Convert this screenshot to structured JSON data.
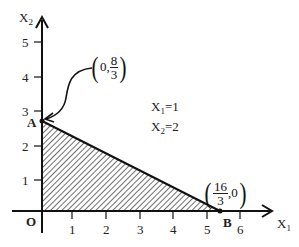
{
  "diagram": {
    "axes": {
      "x_label": "X",
      "x_label_sub": "1",
      "y_label": "X",
      "y_label_sub": "2",
      "origin_label": "O",
      "x_ticks": [
        "1",
        "2",
        "3",
        "4",
        "5",
        "6"
      ],
      "y_ticks": [
        "1",
        "2",
        "3",
        "4",
        "5"
      ]
    },
    "points": {
      "A": {
        "label": "A",
        "coord_left": "0,",
        "num": "8",
        "den": "3",
        "coord_right": ""
      },
      "B": {
        "label": "B",
        "coord_left": "",
        "num": "16",
        "den": "3",
        "coord_right": ",0"
      }
    },
    "annotation": {
      "line1_var": "X",
      "line1_sub": "1",
      "line1_val": "=1",
      "line2_var": "X",
      "line2_sub": "2",
      "line2_val": "=2"
    },
    "region": {
      "fill": "hatched",
      "vertices": [
        "O",
        "A",
        "B"
      ]
    },
    "colors": {
      "ink": "#111111",
      "background": "#ffffff"
    }
  }
}
